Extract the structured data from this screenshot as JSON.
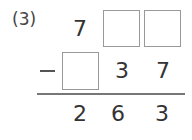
{
  "problem": {
    "label": "(3)",
    "row1": {
      "digit_hundreds": "7",
      "box_tens": "",
      "box_ones": ""
    },
    "row2": {
      "operator": "−",
      "box_hundreds": "",
      "digit_tens": "3",
      "digit_ones": "7"
    },
    "result": {
      "hundreds": "2",
      "tens": "6",
      "ones": "3"
    }
  }
}
